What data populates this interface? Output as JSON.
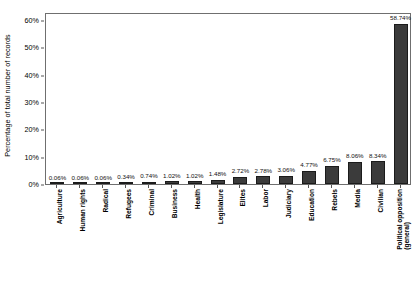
{
  "chart_data": {
    "type": "bar",
    "title": "",
    "subtitle": "",
    "xlabel": "",
    "ylabel": "Percentage of total number of records",
    "ylim": [
      0,
      63
    ],
    "ytick_values": [
      0,
      10,
      20,
      30,
      40,
      50,
      60
    ],
    "ytick_labels": [
      "0%",
      "10%",
      "20%",
      "30%",
      "40%",
      "50%",
      "60%"
    ],
    "grid": false,
    "legend": false,
    "legend_position": "none",
    "bar_color": "#3b3b3b",
    "bar_edge_color": "#1b1b1b",
    "frame_color": "#6f6f6f",
    "background": "#ffffff",
    "categories": [
      "Agriculture",
      "Human rights",
      "Radical",
      "Refugees",
      "Criminal",
      "Business",
      "Health",
      "Legislature",
      "Elites",
      "Labor",
      "Judiciary",
      "Education",
      "Rebels",
      "Media",
      "Civilian",
      "Political opposition (general)"
    ],
    "category_lines": [
      [
        "Agriculture"
      ],
      [
        "Human rights"
      ],
      [
        "Radical"
      ],
      [
        "Refugees"
      ],
      [
        "Criminal"
      ],
      [
        "Business"
      ],
      [
        "Health"
      ],
      [
        "Legislature"
      ],
      [
        "Elites"
      ],
      [
        "Labor"
      ],
      [
        "Judiciary"
      ],
      [
        "Education"
      ],
      [
        "Rebels"
      ],
      [
        "Media"
      ],
      [
        "Civilian"
      ],
      [
        "Political opposition",
        "(general)"
      ]
    ],
    "values": [
      0.06,
      0.06,
      0.06,
      0.34,
      0.74,
      1.02,
      1.02,
      1.48,
      2.72,
      2.78,
      3.06,
      4.77,
      6.75,
      8.06,
      8.34,
      58.74
    ],
    "value_labels": [
      "0.06%",
      "0.06%",
      "0.06%",
      "0.34%",
      "0.74%",
      "1.02%",
      "1.02%",
      "1.48%",
      "2.72%",
      "2.78%",
      "3.06%",
      "4.77%",
      "6.75%",
      "8.06%",
      "8.34%",
      "58.74%"
    ]
  }
}
